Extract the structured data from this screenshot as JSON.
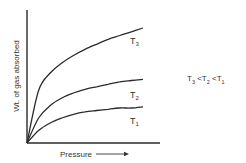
{
  "chart_data": {
    "type": "line",
    "title": "",
    "xlabel": "Pressure",
    "ylabel": "Wt. of gas absorbed",
    "grid": false,
    "legend_position": "inline-labels",
    "x": [
      0,
      0.1,
      0.2,
      0.3,
      0.4,
      0.5,
      0.6,
      0.7,
      0.8,
      0.9,
      1.0
    ],
    "series": [
      {
        "name": "T3",
        "values": [
          0,
          0.42,
          0.56,
          0.64,
          0.7,
          0.75,
          0.79,
          0.83,
          0.86,
          0.89,
          0.92
        ]
      },
      {
        "name": "T2",
        "values": [
          0,
          0.2,
          0.3,
          0.36,
          0.4,
          0.43,
          0.45,
          0.47,
          0.49,
          0.5,
          0.51
        ]
      },
      {
        "name": "T1",
        "values": [
          0,
          0.1,
          0.16,
          0.2,
          0.23,
          0.25,
          0.26,
          0.27,
          0.28,
          0.28,
          0.29
        ]
      }
    ],
    "annotations": [
      "T3 < T2 < T1"
    ],
    "xlim": [
      0,
      1
    ],
    "ylim": [
      0,
      1
    ]
  },
  "labels": {
    "t": "T",
    "s3": "3",
    "s2": "2",
    "s1": "1",
    "lt": "<",
    "xlabel": "Pressure",
    "ylabel": "Wt. of gas absorbed"
  }
}
